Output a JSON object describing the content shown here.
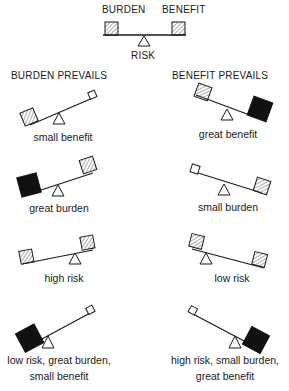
{
  "legend": {
    "left_label": "BURDEN",
    "right_label": "BENEFIT",
    "pivot_label": "RISK"
  },
  "columns": [
    {
      "title": "BURDEN PREVAILS"
    },
    {
      "title": "BENEFIT PREVAILS"
    }
  ],
  "rows": [
    {
      "left": {
        "caption": "small benefit"
      },
      "right": {
        "caption": "great benefit"
      }
    },
    {
      "left": {
        "caption": "great burden"
      },
      "right": {
        "caption": "small burden"
      }
    },
    {
      "left": {
        "caption": "high risk"
      },
      "right": {
        "caption": "low risk"
      }
    },
    {
      "left": {
        "caption_line1": "low risk, great burden,",
        "caption_line2": "small benefit"
      },
      "right": {
        "caption_line1": "high risk, small burden,",
        "caption_line2": "great benefit"
      }
    }
  ],
  "colors": {
    "ink": "#1a1a1a",
    "hatch": "#555555",
    "background": "#ffffff"
  }
}
